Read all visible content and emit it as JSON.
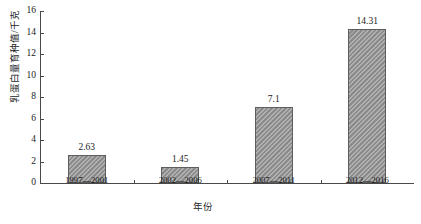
{
  "chart_data": {
    "type": "bar",
    "title": "",
    "categories": [
      "1997—2001",
      "2002—2006",
      "2007—2011",
      "2012—2016"
    ],
    "values": [
      2.63,
      1.45,
      7.1,
      14.31
    ],
    "value_labels": [
      "2.63",
      "1.45",
      "7.1",
      "14.31"
    ],
    "xlabel": "年份",
    "ylabel": "乳蛋白量育种值/千克",
    "ylim": [
      0,
      16
    ],
    "ytick_step": 2,
    "ytick_labels": [
      "16",
      "14",
      "12",
      "10",
      "8",
      "6",
      "4",
      "2",
      "0"
    ],
    "ytick_values": [
      16,
      14,
      12,
      10,
      8,
      6,
      4,
      2,
      0
    ],
    "grid": false,
    "legend": false,
    "legend_position": "none",
    "bar_fill_color": "#9b9b9b",
    "bar_edge_color": "#5d5d5d",
    "axis_color": "#4a4a4a",
    "text_color": "#1a1a1a"
  }
}
